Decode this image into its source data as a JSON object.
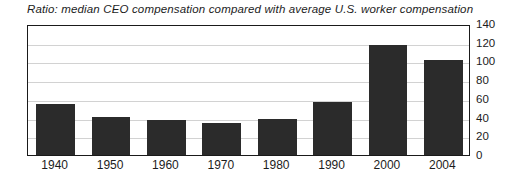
{
  "chart_data": {
    "type": "bar",
    "title": "Ratio: median CEO compensation compared with average U.S. worker compensation",
    "xlabel": "",
    "ylabel": "",
    "categories": [
      "1940",
      "1950",
      "1960",
      "1970",
      "1980",
      "1990",
      "2000",
      "2004"
    ],
    "values": [
      55,
      41,
      37,
      34,
      39,
      57,
      118,
      102
    ],
    "ylim": [
      0,
      140
    ],
    "y_ticks": [
      0,
      20,
      40,
      60,
      80,
      100,
      120,
      140
    ],
    "y_tick_labels": [
      "0",
      "20",
      "40",
      "60",
      "80",
      "100",
      "120",
      "140"
    ],
    "y_axis_position": "right",
    "grid": true,
    "grid_axis": "y",
    "legend": false,
    "series": [
      {
        "name": "CEO-to-worker pay ratio",
        "values": [
          55,
          41,
          37,
          34,
          39,
          57,
          118,
          102
        ]
      }
    ],
    "colors": {
      "bar": "#2b2b2b",
      "frame": "#1a1a1a",
      "gridline": "#d2d2d2",
      "background": "#ffffff",
      "text": "#1c1c1c"
    }
  }
}
